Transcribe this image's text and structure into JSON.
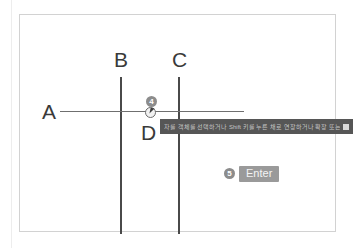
{
  "diagram": {
    "frame": {
      "border_color": "#d2d2d2",
      "background": "#ffffff"
    },
    "labels": [
      {
        "id": "a",
        "text": "A"
      },
      {
        "id": "b",
        "text": "B"
      },
      {
        "id": "c",
        "text": "C"
      },
      {
        "id": "d",
        "text": "D"
      }
    ],
    "lines": [
      {
        "id": "line-b",
        "orientation": "vertical",
        "label": "B",
        "color": "#4a4a4a"
      },
      {
        "id": "line-c",
        "orientation": "vertical",
        "label": "C",
        "color": "#4a4a4a"
      },
      {
        "id": "line-a",
        "orientation": "horizontal",
        "label": "A",
        "color": "#6f6f6f"
      }
    ],
    "steps": [
      {
        "number": "4",
        "badge": "4",
        "name": "click-point"
      },
      {
        "number": "5",
        "badge": "5",
        "name": "confirm-enter"
      }
    ],
    "cursor": {
      "icon": "mouse-cursor-icon"
    }
  },
  "command_bar": {
    "text": "자를 객체를 선택하거나 Shift 키를 누른 채로 연장하거나 확장 또는",
    "end_icon": "overflow-icon",
    "background": "#565656",
    "text_color": "#cfcfcf"
  },
  "enter_button": {
    "label": "Enter",
    "background": "#9a9a9a",
    "text_color": "#f4f4f4"
  }
}
